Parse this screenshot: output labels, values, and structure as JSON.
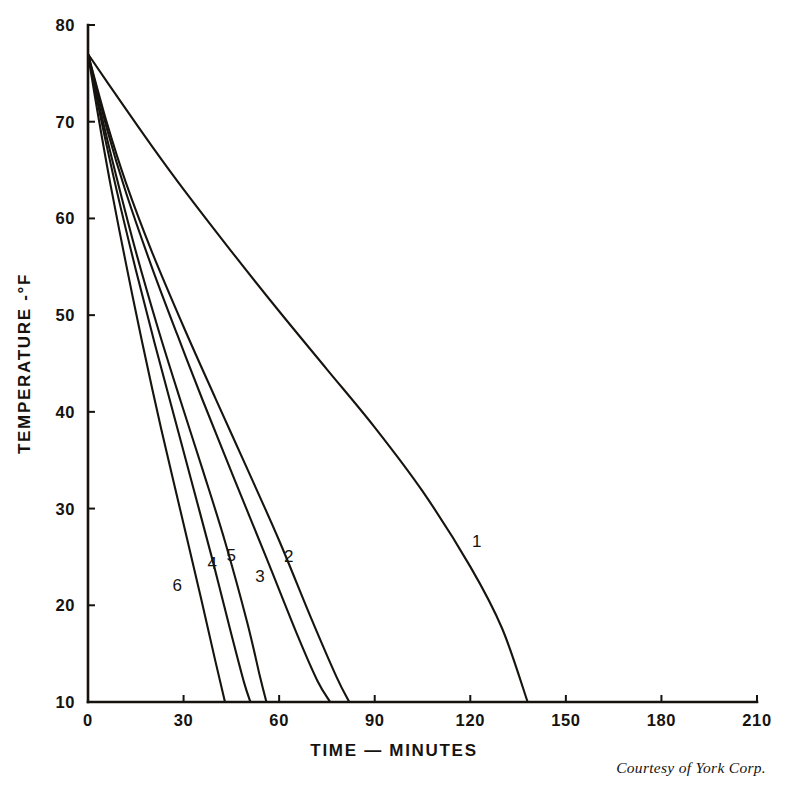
{
  "chart_data": {
    "type": "line",
    "title": "",
    "xlabel": "TIME — MINUTES",
    "ylabel": "TEMPERATURE -°F",
    "xlim": [
      0,
      210
    ],
    "ylim": [
      10,
      80
    ],
    "xticks": [
      0,
      30,
      60,
      90,
      120,
      150,
      180,
      210
    ],
    "yticks": [
      10,
      20,
      30,
      40,
      50,
      60,
      70,
      80
    ],
    "xtick_labels": [
      "0",
      "30",
      "60",
      "90",
      "120",
      "150",
      "180",
      "210"
    ],
    "ytick_labels": [
      "10",
      "20",
      "30",
      "40",
      "50",
      "60",
      "70",
      "80"
    ],
    "grid": false,
    "legend": "inline-curve-labels",
    "line_color": "#17140f",
    "background_color": "#ffffff",
    "series": [
      {
        "name": "1",
        "label": "1",
        "label_x": 122,
        "label_y": 26,
        "x": [
          0,
          10,
          20,
          30,
          45,
          60,
          75,
          90,
          105,
          120,
          130,
          138
        ],
        "y": [
          77.0,
          72.2,
          67.5,
          63.0,
          56.6,
          50.4,
          44.4,
          38.4,
          31.8,
          24.0,
          17.6,
          10.0
        ]
      },
      {
        "name": "2",
        "label": "2",
        "label_x": 63,
        "label_y": 24.5,
        "x": [
          0,
          6,
          12,
          20,
          30,
          40,
          50,
          60,
          70,
          78,
          82
        ],
        "y": [
          77.0,
          69.8,
          63.6,
          56.6,
          48.8,
          41.4,
          34.1,
          26.7,
          18.7,
          12.6,
          10.0
        ]
      },
      {
        "name": "3",
        "label": "3",
        "label_x": 54,
        "label_y": 22.4,
        "x": [
          0,
          6,
          12,
          20,
          28,
          36,
          46,
          56,
          66,
          72,
          76
        ],
        "y": [
          77.0,
          69.2,
          62.6,
          55.0,
          48.0,
          41.2,
          33.0,
          24.9,
          16.7,
          12.2,
          10.0
        ]
      },
      {
        "name": "4",
        "label": "4",
        "label_x": 39,
        "label_y": 23.8,
        "x": [
          0,
          4,
          9,
          15,
          21,
          27,
          33,
          39,
          45,
          49,
          51
        ],
        "y": [
          77.0,
          70.4,
          62.9,
          54.7,
          47.0,
          39.6,
          32.2,
          24.8,
          17.0,
          12.0,
          10.0
        ]
      },
      {
        "name": "5",
        "label": "5",
        "label_x": 45,
        "label_y": 24.6,
        "x": [
          0,
          4,
          9,
          15,
          22,
          29,
          36,
          43,
          50,
          54,
          56
        ],
        "y": [
          77.0,
          71.0,
          64.2,
          56.6,
          48.6,
          41.2,
          34.0,
          26.6,
          18.2,
          12.6,
          10.0
        ]
      },
      {
        "name": "6",
        "label": "6",
        "label_x": 28,
        "label_y": 21.5,
        "x": [
          0,
          3,
          7,
          12,
          17,
          23,
          29,
          35,
          40,
          43
        ],
        "y": [
          77.0,
          71.0,
          63.6,
          55.2,
          47.2,
          38.2,
          29.8,
          21.4,
          14.2,
          10.0
        ]
      }
    ]
  },
  "credit": {
    "text": "Courtesy of York Corp."
  }
}
